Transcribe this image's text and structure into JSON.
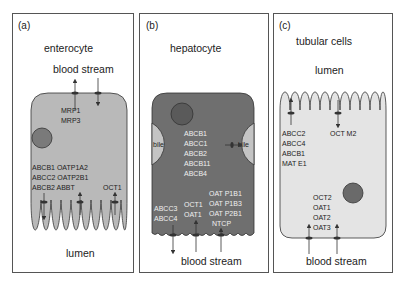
{
  "figure": {
    "panels": [
      {
        "id": "a",
        "label": "(a)",
        "title": "enterocyte",
        "top_label": "blood stream",
        "bottom_label": "lumen",
        "transporters": {
          "basolateral": [
            "MRP1",
            "MRP3"
          ],
          "apical_left": [
            "ABCB1 OATP1A2",
            "ABCC2 OATP2B1",
            "ABCB2 ABBT"
          ],
          "apical_right": [
            "OCT1"
          ]
        }
      },
      {
        "id": "b",
        "label": "(b)",
        "title": "hepatocyte",
        "bile_left": "bile",
        "bile_right": "bile",
        "bottom_label": "blood stream",
        "transporters": {
          "canalicular": [
            "ABCB1",
            "ABCC1",
            "ABCB2",
            "ABCB11",
            "ABCB4"
          ],
          "basolateral_left": [
            "ABCC3",
            "ABCC4"
          ],
          "basolateral_mid": [
            "OCT1",
            "OAT1"
          ],
          "basolateral_right": [
            "OAT P1B1",
            "OAT P1B3",
            "OAT P2B1",
            "NTCP"
          ]
        }
      },
      {
        "id": "c",
        "label": "(c)",
        "title": "tubular cells",
        "top_label": "lumen",
        "bottom_label": "blood stream",
        "transporters": {
          "apical_left": [
            "ABCC2",
            "ABCC4",
            "ABCB1",
            "MAT E1"
          ],
          "apical_right": [
            "OCT M2"
          ],
          "basolateral": [
            "OCT2",
            "OAT1",
            "OAT2",
            "OAT3"
          ]
        }
      }
    ],
    "colors": {
      "enterocyte_fill": "#b9b9b9",
      "hepatocyte_fill": "#6f6f6f",
      "bile_fill": "#c4c4c4",
      "tubular_fill": "#e4e4e4",
      "nucleus_a": "#7a7a7a",
      "nucleus_b": "#5a5a5a",
      "nucleus_c": "#6a6a6a",
      "border": "#555555"
    }
  }
}
